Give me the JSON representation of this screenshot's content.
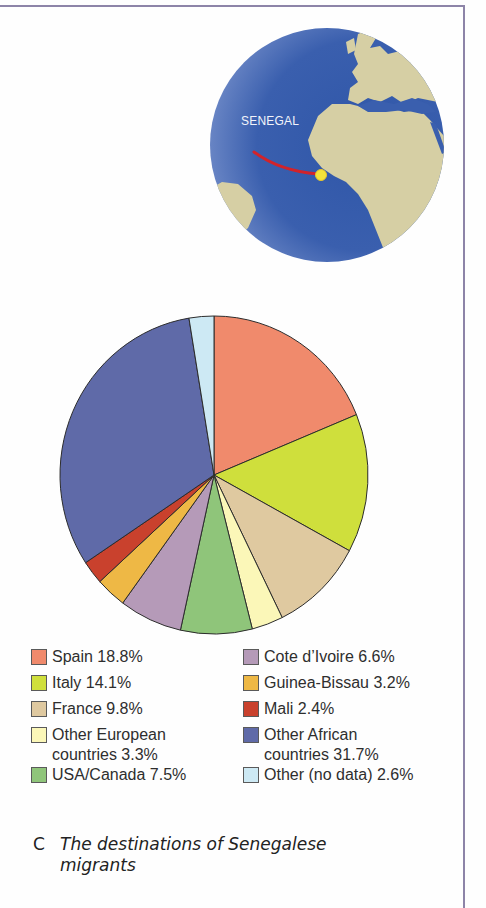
{
  "frame": {
    "border_color": "#8d84a8"
  },
  "globe": {
    "label": "SENEGAL",
    "ocean_color": "#3a5fae",
    "land_color": "#d6cfa4",
    "arrow_color": "#d2232a",
    "marker_color": "#f3e23a"
  },
  "chart_data": {
    "type": "pie",
    "title": "The destinations of Senegalese migrants",
    "start_angle": "12 o'clock",
    "direction": "clockwise",
    "legend_position": "bottom",
    "categories": [
      "Spain",
      "Italy",
      "France",
      "Other European countries",
      "USA/Canada",
      "Cote d'Ivoire",
      "Guinea-Bissau",
      "Mali",
      "Other African countries",
      "Other (no data)"
    ],
    "values": [
      18.8,
      14.1,
      9.8,
      3.3,
      7.5,
      6.6,
      3.2,
      2.4,
      31.7,
      2.6
    ],
    "unit": "%",
    "colors": [
      "#f08a6c",
      "#cfdf3c",
      "#dfc9a0",
      "#fbf7b8",
      "#8fc57a",
      "#b59ab8",
      "#eeb845",
      "#c9412d",
      "#5f6aa8",
      "#cde9f4"
    ]
  },
  "legend": {
    "left": [
      {
        "label": "Spain 18.8%",
        "color": "#f08a6c"
      },
      {
        "label": "Italy 14.1%",
        "color": "#cfdf3c"
      },
      {
        "label": "France 9.8%",
        "color": "#dfc9a0"
      },
      {
        "label_line1": "Other European",
        "label_line2": "countries 3.3%",
        "color": "#fbf7b8"
      },
      {
        "label": "USA/Canada 7.5%",
        "color": "#8fc57a"
      }
    ],
    "right": [
      {
        "label": "Cote d’Ivoire 6.6%",
        "color": "#b59ab8"
      },
      {
        "label": "Guinea-Bissau 3.2%",
        "color": "#eeb845"
      },
      {
        "label": "Mali 2.4%",
        "color": "#c9412d"
      },
      {
        "label_line1": "Other African",
        "label_line2": "countries 31.7%",
        "color": "#5f6aa8"
      },
      {
        "label": "Other (no data) 2.6%",
        "color": "#cde9f4"
      }
    ]
  },
  "caption": {
    "letter": "C",
    "text": "The destinations of Senegalese migrants"
  }
}
